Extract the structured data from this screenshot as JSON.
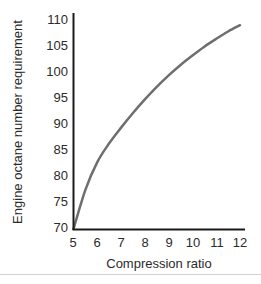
{
  "chart_data": {
    "type": "line",
    "title": "",
    "subtitle": "",
    "xlabel": "Compression ratio",
    "ylabel": "Engine octane number requirement",
    "xlim": [
      5,
      12
    ],
    "ylim": [
      70,
      110
    ],
    "xticks": [
      5,
      6,
      7,
      8,
      9,
      10,
      11,
      12
    ],
    "yticks": [
      70,
      75,
      80,
      85,
      90,
      95,
      100,
      105,
      110
    ],
    "xtick_labels": [
      "5",
      "6",
      "7",
      "8",
      "9",
      "10",
      "11",
      "12"
    ],
    "ytick_labels": [
      "70",
      "75",
      "80",
      "85",
      "90",
      "95",
      "100",
      "105",
      "110"
    ],
    "grid": false,
    "legend": null,
    "legend_position": "none",
    "annotations": [],
    "series": [
      {
        "name": "Engine octane number requirement",
        "color": "#6e6e6e",
        "line_width": 2.5,
        "marker": "none",
        "x": [
          5,
          5.5,
          6,
          6.5,
          7,
          7.5,
          8,
          8.5,
          9,
          9.5,
          10,
          10.5,
          11,
          11.5,
          12
        ],
        "values": [
          70,
          77.5,
          82.8,
          86.4,
          89.4,
          92.2,
          94.8,
          97.2,
          99.4,
          101.4,
          103.2,
          104.9,
          106.4,
          107.8,
          109
        ]
      }
    ]
  },
  "axes": {
    "spine_color": "#1a1a1a",
    "background": "#ffffff"
  },
  "footer": {
    "rule_color": "#d2d2d2"
  }
}
